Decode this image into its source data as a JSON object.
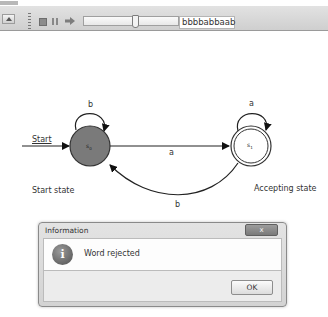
{
  "toolbar": {
    "buttons": [
      {
        "name": "stop",
        "icon": "stop-icon"
      },
      {
        "name": "pause",
        "icon": "pause-icon"
      },
      {
        "name": "step",
        "icon": "arrow-right-icon"
      }
    ],
    "slider": {
      "position_pct": 52
    },
    "word_input": {
      "value": "bbbbabbaab"
    }
  },
  "diagram": {
    "start_arrow_label": "Start",
    "states": [
      {
        "id": "s0",
        "label": "s",
        "subscript": "0",
        "fill": "#7a7a7a",
        "accepting": false,
        "caption": "Start state"
      },
      {
        "id": "s1",
        "label": "s",
        "subscript": "1",
        "fill": "#ffffff",
        "accepting": true,
        "caption": "Accepting state"
      }
    ],
    "transitions": [
      {
        "from": "s0",
        "to": "s0",
        "symbol": "b"
      },
      {
        "from": "s1",
        "to": "s1",
        "symbol": "a"
      },
      {
        "from": "s0",
        "to": "s1",
        "symbol": "a"
      },
      {
        "from": "s1",
        "to": "s0",
        "symbol": "b"
      }
    ]
  },
  "dialog": {
    "title": "Information",
    "close_label": "x",
    "icon": "info-icon",
    "icon_glyph": "i",
    "message": "Word rejected",
    "ok_label": "OK"
  }
}
